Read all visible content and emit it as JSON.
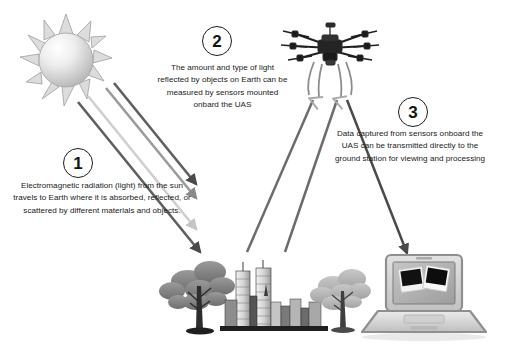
{
  "diagram": {
    "background_color": "#ffffff",
    "steps": [
      {
        "number": "1",
        "text": "Electromagnetic radiation (light) from the sun travels to Earth where it is absorbed, reflected, or scattered by different materials and objects."
      },
      {
        "number": "2",
        "text": "The amount and type of light reflected by objects on Earth can be measured by sensors mounted onbard the UAS"
      },
      {
        "number": "3",
        "text": "Data captured from sensors onboard the UAS can be transmitted directly to the ground station for viewing and processing"
      }
    ],
    "illustrations": [
      {
        "name": "sun-illustration",
        "label": "Sun"
      },
      {
        "name": "drone-illustration",
        "label": "UAS hexacopter drone"
      },
      {
        "name": "city-and-trees-illustration",
        "label": "Trees and city skyline on Earth"
      },
      {
        "name": "laptop-illustration",
        "label": "Laptop ground station displaying captured photos"
      }
    ],
    "arrows": [
      {
        "name": "sunlight-ray-arrow",
        "label": "Sunlight ray travelling to Earth",
        "color": "#5c5c5c",
        "count": 4
      },
      {
        "name": "reflected-light-arrow",
        "label": "Reflected light from Earth to UAS sensors",
        "color": "#b9b9b9",
        "count": 2
      },
      {
        "name": "data-transmission-arrow",
        "label": "Data transmitted from UAS to ground station",
        "color": "#4a4a4a",
        "count": 1
      }
    ],
    "colors": {
      "line_dark": "#4a4a4a",
      "line_mid": "#8e8e8e",
      "line_light": "#c9c9c9",
      "text": "#1a1a1a",
      "sun_fill": "#e8e8e8",
      "laptop_body": "#d8d8d8"
    }
  }
}
